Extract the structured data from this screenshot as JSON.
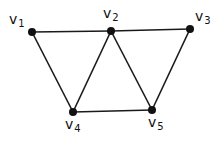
{
  "graph": {
    "nodes": [
      {
        "id": "v1",
        "base": "v",
        "sub": "1",
        "x": 32,
        "y": 32,
        "lx": 9,
        "ly": 12
      },
      {
        "id": "v2",
        "base": "v",
        "sub": "2",
        "x": 111,
        "y": 31,
        "lx": 103,
        "ly": 6
      },
      {
        "id": "v3",
        "base": "v",
        "sub": "3",
        "x": 190,
        "y": 29,
        "lx": 195,
        "ly": 9
      },
      {
        "id": "v4",
        "base": "v",
        "sub": "4",
        "x": 73,
        "y": 112,
        "lx": 65,
        "ly": 117
      },
      {
        "id": "v5",
        "base": "v",
        "sub": "5",
        "x": 152,
        "y": 110,
        "lx": 148,
        "ly": 115
      }
    ],
    "edges": [
      [
        "v1",
        "v2"
      ],
      [
        "v2",
        "v3"
      ],
      [
        "v1",
        "v4"
      ],
      [
        "v2",
        "v4"
      ],
      [
        "v2",
        "v5"
      ],
      [
        "v3",
        "v5"
      ],
      [
        "v4",
        "v5"
      ]
    ],
    "colors": {
      "edge": "#1a1a1a",
      "node": "#111111",
      "background": "#ffffff"
    }
  }
}
